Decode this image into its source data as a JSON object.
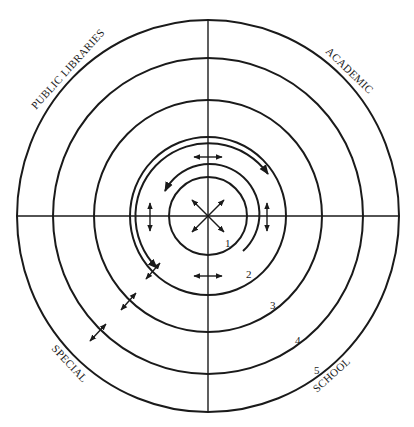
{
  "diagram": {
    "type": "concentric-circle diagram divided into four quadrants",
    "quadrant_labels": {
      "top_left": "PUBLIC LIBRARIES",
      "top_right": "ACADEMIC",
      "bottom_left": "SPECIAL",
      "bottom_right": "SCHOOL"
    },
    "ring_numbers": [
      "1",
      "2",
      "3",
      "4",
      "5"
    ],
    "rings": [
      {
        "number": "1",
        "radius": 39
      },
      {
        "number": "2",
        "radius": 79
      },
      {
        "number": "3",
        "radius": 115
      },
      {
        "number": "4",
        "radius": 157
      },
      {
        "number": "5",
        "radius": 193
      }
    ],
    "arrows": {
      "center": "four-way diagonal arrows radiating from center",
      "ring_1_2": "curved circular arrows and short double-headed arrows between rings 1 and 2",
      "radial": "double-headed arrows crossing rings 2, 3 and 4 along the lower-left diagonal"
    },
    "colors": {
      "stroke": "#1a1a1a",
      "background": "#ffffff"
    }
  }
}
